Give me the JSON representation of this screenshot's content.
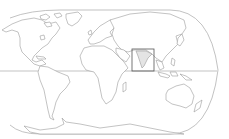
{
  "map": {
    "type": "locator-map",
    "projection": "world, rounded-edge pseudo-cylindrical",
    "highlighted_region": "India / South Asia",
    "highlight_box": {
      "x": 132,
      "y": 49,
      "width": 22,
      "height": 22
    },
    "colors": {
      "background": "#ffffff",
      "land_fill": "#ffffff",
      "outline": "#9a9a9a",
      "highlight_fill": "#e4e4e4",
      "box_stroke": "#555555"
    },
    "features": [
      "equator-line",
      "continent-outlines",
      "locator-box"
    ]
  }
}
